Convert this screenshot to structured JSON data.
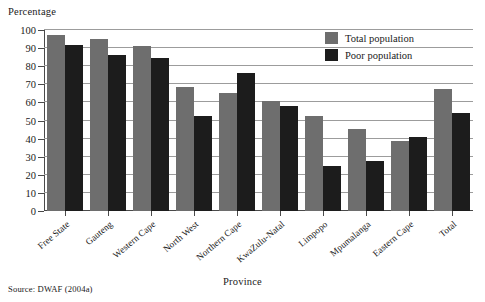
{
  "chart_data": {
    "type": "bar",
    "title": "",
    "xlabel": "Province",
    "ylabel": "Percentage",
    "ylim": [
      0,
      100
    ],
    "ytick_step": 10,
    "yticks": [
      100,
      90,
      80,
      70,
      60,
      50,
      40,
      30,
      20,
      10,
      0
    ],
    "grid": true,
    "legend_position": "top-right",
    "categories": [
      "Free State",
      "Gauteng",
      "Western Cape",
      "North West",
      "Northern Cape",
      "KwaZulu-Natal",
      "Limpopo",
      "Mpumalanga",
      "Eastern Cape",
      "Total"
    ],
    "series": [
      {
        "name": "Total population",
        "color": "#6e6e6e",
        "values": [
          97,
          95,
          91,
          68.5,
          65,
          61,
          52.5,
          45.5,
          38.5,
          67.5
        ]
      },
      {
        "name": "Poor population",
        "color": "#1c1c1c",
        "values": [
          91.5,
          86,
          84.5,
          52.5,
          76,
          58,
          25,
          27.5,
          41,
          54
        ]
      }
    ],
    "source": "Source: DWAF (2004a)"
  },
  "axis": {
    "y_title": "Percentage",
    "x_title": "Province"
  },
  "legend": {
    "items": [
      {
        "label": "Total population",
        "color": "#6e6e6e"
      },
      {
        "label": "Poor population",
        "color": "#1c1c1c"
      }
    ]
  },
  "footer": {
    "source": "Source: DWAF (2004a)"
  }
}
